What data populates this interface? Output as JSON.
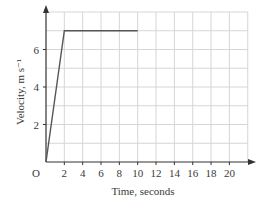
{
  "chart_data": {
    "type": "line",
    "title": "",
    "xlabel": "Time, seconds",
    "ylabel": "Velocity, m s⁻¹",
    "origin_label": "O",
    "xlim": [
      0,
      22
    ],
    "ylim": [
      0,
      8
    ],
    "x_ticks": [
      2,
      4,
      6,
      8,
      10,
      12,
      14,
      16,
      18,
      20
    ],
    "y_ticks": [
      2,
      4,
      6
    ],
    "grid": true,
    "series": [
      {
        "name": "velocity",
        "x": [
          0,
          2,
          10
        ],
        "y": [
          0,
          7,
          7
        ]
      }
    ],
    "colors": {
      "line": "#555555",
      "grid": "#d6d6d6",
      "axis": "#333333"
    }
  }
}
